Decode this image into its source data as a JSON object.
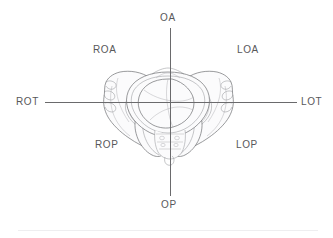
{
  "figure": {
    "type": "anatomical-diagram",
    "view": "maternal pelvis viewed from below with fetal head at pelvic inlet"
  },
  "axes": {
    "top_label": "OA",
    "bottom_label": "OP",
    "left_label": "ROT",
    "right_label": "LOT"
  },
  "quadrants": {
    "upper_left": "ROA",
    "upper_right": "LOA",
    "lower_left": "ROP",
    "lower_right": "LOP"
  },
  "colors": {
    "text": "#58585a",
    "axis": "#6a6a6c",
    "bone_outline": "#6f7073",
    "bone_fill": "#fbfbfc",
    "background": "#ffffff",
    "footer_rule": "#eeeef0"
  }
}
